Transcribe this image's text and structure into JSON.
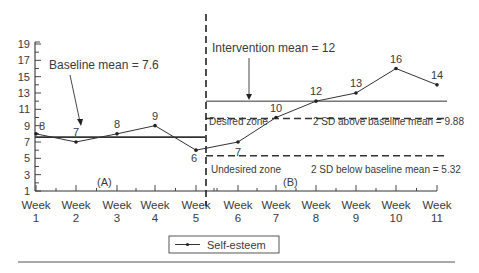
{
  "chart_data": {
    "type": "line",
    "title": "",
    "xlabel": "",
    "ylabel": "",
    "ylim": [
      1,
      19
    ],
    "y_ticks": [
      1,
      3,
      5,
      7,
      9,
      11,
      13,
      15,
      17,
      19
    ],
    "categories": [
      "Week 1",
      "Week 2",
      "Week 3",
      "Week 4",
      "Week 5",
      "Week 6",
      "Week 7",
      "Week 8",
      "Week 9",
      "Week 10",
      "Week 11"
    ],
    "series": [
      {
        "name": "Self-esteem",
        "values": [
          8,
          7,
          8,
          9,
          6,
          7,
          10,
          12,
          13,
          16,
          14
        ]
      }
    ],
    "phases": [
      {
        "label": "(A)",
        "weeks": [
          1,
          5
        ]
      },
      {
        "label": "(B)",
        "weeks": [
          6,
          11
        ]
      }
    ],
    "reference_lines": [
      {
        "label": "Baseline mean = 7.6",
        "value": 7.6,
        "style": "solid",
        "phase": "A"
      },
      {
        "label": "Intervention mean = 12",
        "value": 12,
        "style": "solid",
        "phase": "B"
      },
      {
        "label": "2 SD above baseline mean = 9.88",
        "value": 9.88,
        "style": "dashed",
        "phase": "B"
      },
      {
        "label": "2 SD below baseline mean = 5.32",
        "value": 5.32,
        "style": "dashed",
        "phase": "B"
      }
    ],
    "zones": [
      {
        "label": "Desired zone"
      },
      {
        "label": "Undesired zone"
      }
    ],
    "grid": false,
    "legend_position": "bottom"
  },
  "labels": {
    "baseline_mean": "Baseline mean = 7.6",
    "intervention_mean": "Intervention mean = 12",
    "sd_above": "2 SD above baseline mean = 9.88",
    "sd_below": "2 SD below baseline mean = 5.32",
    "desired_zone": "Desired zone",
    "undesired_zone": "Undesired zone",
    "phase_a": "(A)",
    "phase_b": "(B)",
    "legend": "Self-esteem",
    "week_word": "Week"
  }
}
